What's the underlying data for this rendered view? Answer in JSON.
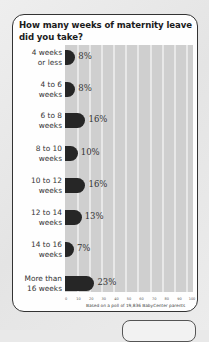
{
  "chart_data": {
    "type": "bar",
    "orientation": "horizontal",
    "title": "How many weeks of maternity leave did you take?",
    "categories": [
      "4 weeks or less",
      "4 to 6 weeks",
      "6 to 8 weeks",
      "8 to 10 weeks",
      "10 to 12 weeks",
      "12 to 14 weeks",
      "14 to 16 weeks",
      "More than 16 weeks"
    ],
    "values": [
      8,
      8,
      16,
      10,
      16,
      13,
      7,
      23
    ],
    "value_labels": [
      "8%",
      "8%",
      "16%",
      "10%",
      "16%",
      "13%",
      "7%",
      "23%"
    ],
    "xlabel": "",
    "ylabel": "",
    "xlim": [
      0,
      100
    ],
    "xticks": [
      "0",
      "10",
      "20",
      "30",
      "40",
      "50",
      "60",
      "70",
      "80",
      "90",
      "100"
    ],
    "grid": true,
    "footnote": "Based on a poll of 19,836 BabyCenter parents",
    "colors": {
      "bar": "#262626",
      "plot_bg": "#cfcfcf",
      "gridline": "#e8e8e8"
    }
  },
  "labels": [
    [
      "4 weeks",
      "or less"
    ],
    [
      "4 to 6",
      "weeks"
    ],
    [
      "6 to 8",
      "weeks"
    ],
    [
      "8 to 10",
      "weeks"
    ],
    [
      "10 to 12",
      "weeks"
    ],
    [
      "12 to 14",
      "weeks"
    ],
    [
      "14 to 16",
      "weeks"
    ],
    [
      "More than",
      "16 weeks"
    ]
  ]
}
